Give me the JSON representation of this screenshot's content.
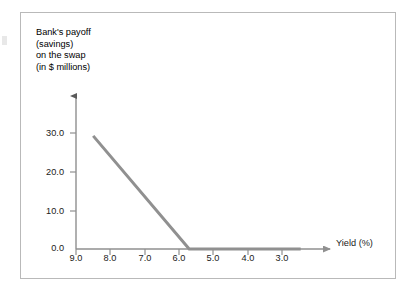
{
  "figure": {
    "frame_color": "#b9b9b9",
    "background": "#ffffff"
  },
  "chart_data": {
    "type": "line",
    "title": "",
    "ylabel": "Bank's payoff (savings) on the swap (in $ millions)",
    "ylabel_lines": [
      "Bank's payoff",
      "(savings)",
      "on the swap",
      "(in $ millions)"
    ],
    "xlabel": "Yield (%)",
    "xlim": [
      9.0,
      2.3
    ],
    "ylim": [
      0.0,
      35.0
    ],
    "x_axis_reversed": true,
    "grid": false,
    "legend": null,
    "xticks": [
      9.0,
      8.0,
      7.0,
      6.0,
      5.0,
      4.0,
      3.0
    ],
    "xtick_labels": [
      "9.0",
      "8.0",
      "7.0",
      "6.0",
      "5.0",
      "4.0",
      "3.0"
    ],
    "yticks": [
      0.0,
      10.0,
      20.0,
      30.0
    ],
    "ytick_labels": [
      "0.0",
      "10.0",
      "20.0",
      "30.0"
    ],
    "series": [
      {
        "name": "Bank's payoff on the swap",
        "color": "#909090",
        "line_width": 3,
        "points": [
          {
            "x": 8.5,
            "y": 29.0
          },
          {
            "x": 5.7,
            "y": 0.0
          },
          {
            "x": 2.45,
            "y": 0.0
          }
        ]
      }
    ],
    "annotations": [
      {
        "text": "kink at yield 5.7%, payoff flattens to 0.0"
      }
    ]
  },
  "axes": {
    "y_arrow": "arrow-up",
    "x_arrow": "arrow-right",
    "axis_color": "#8f8f8f"
  }
}
